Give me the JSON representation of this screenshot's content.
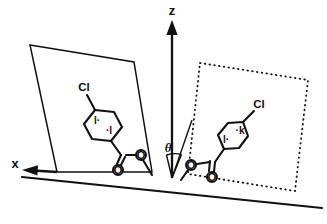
{
  "figure": {
    "background_color": "#ffffff",
    "ink_color": "#111111"
  },
  "axes": {
    "z": {
      "label": "z",
      "name": "surface-normal-axis",
      "arrow": "up"
    },
    "x": {
      "label": "x",
      "name": "surface-x-axis",
      "arrow": "left"
    },
    "angle": {
      "label": "θ",
      "name": "tilt-angle",
      "between": [
        "z",
        "molecular-director"
      ]
    }
  },
  "planes": {
    "left": {
      "name": "left-molecular-plane",
      "style": "solid",
      "points": "30,45 134,62 152,172 57,172"
    },
    "right": {
      "name": "right-molecular-plane",
      "style": "dotted",
      "points": "200,63 308,80 295,191 188,174"
    }
  },
  "molecules": [
    {
      "id": "left-molecule",
      "name": "left-chlorophenyl-ester",
      "chlorine_label": "Cl",
      "ring_marks": [
        "l·",
        "·l"
      ],
      "ester_oxygens": [
        "O",
        "O"
      ]
    },
    {
      "id": "right-molecule",
      "name": "right-chlorophenyl-ester",
      "chlorine_label": "Cl",
      "ring_marks": [
        "l·",
        "·k"
      ],
      "ester_oxygens": [
        "O",
        "O"
      ]
    }
  ],
  "baseline": {
    "name": "surface-baseline",
    "from": "20,178",
    "to": "322,208"
  }
}
